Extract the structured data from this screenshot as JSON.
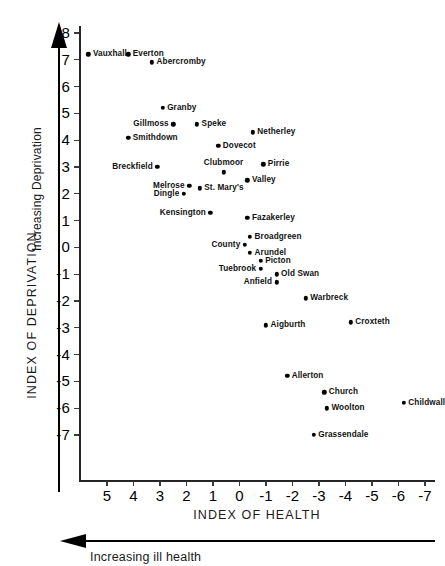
{
  "chart_data": {
    "type": "scatter",
    "title": "",
    "xlabel": "INDEX OF HEALTH",
    "ylabel": "INDEX OF DEPRIVATION",
    "x_axis_note": "Increasing ill health",
    "y_axis_note": "Increasing Deprivation",
    "x_ticks": [
      "5",
      "4",
      "3",
      "2",
      "1",
      "0",
      "-1",
      "-2",
      "-3",
      "-4",
      "-5",
      "-6",
      "-7"
    ],
    "y_ticks": [
      "8",
      "7",
      "6",
      "5",
      "4",
      "3",
      "2",
      "1",
      "0",
      "-1",
      "-2",
      "-3",
      "-4",
      "-5",
      "-6",
      "-7"
    ],
    "xlim": [
      5.8,
      -7.4
    ],
    "ylim": [
      -7.6,
      8.4
    ],
    "x_reversed": true,
    "grid": false,
    "legend": "none",
    "point_color": "#000000",
    "axis_color": "#262626",
    "points": [
      {
        "label": "Vauxhall",
        "x": 5.7,
        "y": 7.2,
        "label_side": "right"
      },
      {
        "label": "Everton",
        "x": 4.2,
        "y": 7.2,
        "label_side": "right"
      },
      {
        "label": "Abercromby",
        "x": 3.3,
        "y": 6.9,
        "label_side": "right"
      },
      {
        "label": "Granby",
        "x": 2.9,
        "y": 5.2,
        "label_side": "right"
      },
      {
        "label": "Gillmoss",
        "x": 2.5,
        "y": 4.6,
        "label_side": "left"
      },
      {
        "label": "Speke",
        "x": 1.6,
        "y": 4.6,
        "label_side": "right"
      },
      {
        "label": "Smithdown",
        "x": 4.2,
        "y": 4.1,
        "label_side": "right"
      },
      {
        "label": "Netherley",
        "x": -0.5,
        "y": 4.3,
        "label_side": "right"
      },
      {
        "label": "Dovecot",
        "x": 0.8,
        "y": 3.8,
        "label_side": "right"
      },
      {
        "label": "Breckfield",
        "x": 3.1,
        "y": 3.0,
        "label_side": "left"
      },
      {
        "label": "Pirrie",
        "x": -0.9,
        "y": 3.1,
        "label_side": "right"
      },
      {
        "label": "Clubmoor",
        "x": 0.6,
        "y": 2.8,
        "label_side": "above"
      },
      {
        "label": "Valley",
        "x": -0.3,
        "y": 2.5,
        "label_side": "right"
      },
      {
        "label": "Melrose",
        "x": 1.9,
        "y": 2.3,
        "label_side": "left"
      },
      {
        "label": "St. Mary's",
        "x": 1.5,
        "y": 2.2,
        "label_side": "right"
      },
      {
        "label": "Dingle",
        "x": 2.1,
        "y": 2.0,
        "label_side": "left"
      },
      {
        "label": "Kensington",
        "x": 1.1,
        "y": 1.3,
        "label_side": "left"
      },
      {
        "label": "Fazakerley",
        "x": -0.3,
        "y": 1.1,
        "label_side": "right"
      },
      {
        "label": "Broadgreen",
        "x": -0.4,
        "y": 0.4,
        "label_side": "right"
      },
      {
        "label": "County",
        "x": -0.2,
        "y": 0.1,
        "label_side": "left"
      },
      {
        "label": "Arundel",
        "x": -0.4,
        "y": -0.2,
        "label_side": "right"
      },
      {
        "label": "Picton",
        "x": -0.8,
        "y": -0.5,
        "label_side": "right"
      },
      {
        "label": "Tuebrook",
        "x": -0.8,
        "y": -0.8,
        "label_side": "left"
      },
      {
        "label": "Old Swan",
        "x": -1.4,
        "y": -1.0,
        "label_side": "right"
      },
      {
        "label": "Anfield",
        "x": -1.4,
        "y": -1.3,
        "label_side": "left"
      },
      {
        "label": "Warbreck",
        "x": -2.5,
        "y": -1.9,
        "label_side": "right"
      },
      {
        "label": "Aigburth",
        "x": -1.0,
        "y": -2.9,
        "label_side": "right"
      },
      {
        "label": "Croxteth",
        "x": -4.2,
        "y": -2.8,
        "label_side": "right"
      },
      {
        "label": "Allerton",
        "x": -1.8,
        "y": -4.8,
        "label_side": "right"
      },
      {
        "label": "Church",
        "x": -3.2,
        "y": -5.4,
        "label_side": "right"
      },
      {
        "label": "Childwall",
        "x": -6.2,
        "y": -5.8,
        "label_side": "right"
      },
      {
        "label": "Woolton",
        "x": -3.3,
        "y": -6.0,
        "label_side": "right"
      },
      {
        "label": "Grassendale",
        "x": -2.8,
        "y": -7.0,
        "label_side": "right"
      }
    ]
  }
}
